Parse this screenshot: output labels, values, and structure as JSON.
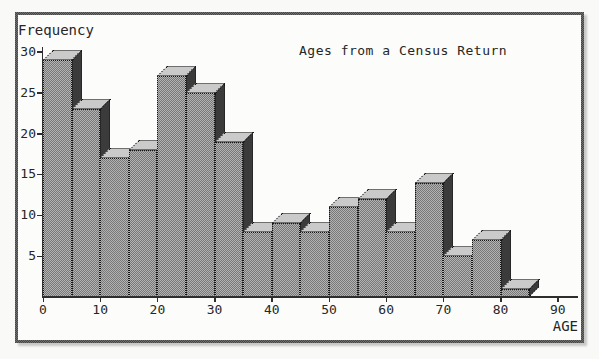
{
  "figure": {
    "kind": "scanned textbook histogram",
    "background_color": "#fcfcfa",
    "frame_color": "#5a5a5a",
    "ink_color": "#262626"
  },
  "chart_data": {
    "type": "bar",
    "title": "Ages from a Census Return",
    "xlabel": "AGE",
    "ylabel": "Frequency",
    "bin_width": 5,
    "bin_starts": [
      0,
      5,
      10,
      15,
      20,
      25,
      30,
      35,
      40,
      45,
      50,
      55,
      60,
      65,
      70,
      75,
      80
    ],
    "categories": [
      "0-5",
      "5-10",
      "10-15",
      "15-20",
      "20-25",
      "25-30",
      "30-35",
      "35-40",
      "40-45",
      "45-50",
      "50-55",
      "55-60",
      "60-65",
      "65-70",
      "70-75",
      "75-80",
      "80-85"
    ],
    "values": [
      29,
      23,
      17,
      18,
      27,
      25,
      19,
      8,
      9,
      8,
      11,
      12,
      8,
      14,
      5,
      7,
      1
    ],
    "x_ticks": [
      0,
      10,
      20,
      30,
      40,
      50,
      60,
      70,
      80,
      90
    ],
    "y_ticks": [
      5,
      10,
      15,
      20,
      25,
      30
    ],
    "xlim": [
      0,
      93
    ],
    "ylim": [
      0,
      30
    ],
    "grid": false,
    "legend": null,
    "style_3d": true,
    "bar_front_color": "#969696",
    "bar_top_color": "#d2d2d2",
    "bar_side_color": "#2e2e2e"
  }
}
